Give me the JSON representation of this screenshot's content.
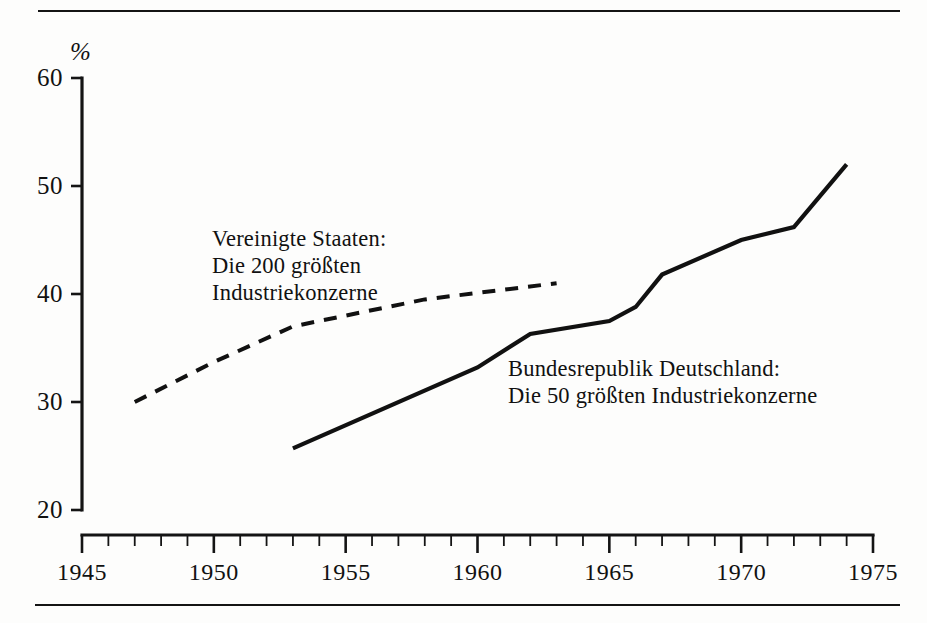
{
  "chart_data": {
    "type": "line",
    "title": "",
    "subtitle": "",
    "xlabel": "",
    "ylabel": "%",
    "unit_symbol": "%",
    "xlim": [
      1945,
      1975
    ],
    "ylim": [
      20,
      60
    ],
    "grid": false,
    "legend_position": "inline-annotations",
    "x_ticks_major": [
      1945,
      1950,
      1955,
      1960,
      1965,
      1970,
      1975
    ],
    "x_tick_labels": [
      "1945",
      "1950",
      "1955",
      "1960",
      "1965",
      "1970",
      "1975"
    ],
    "x_ticks_minor_step": 1,
    "y_ticks": [
      20,
      30,
      40,
      50,
      60
    ],
    "y_tick_labels": [
      "20",
      "30",
      "40",
      "50",
      "60"
    ],
    "series": [
      {
        "name": "Vereinigte Staaten: Die 200 größten Industriekonzerne",
        "style": "dashed",
        "annotation_lines": [
          "Vereinigte Staaten:",
          "Die 200 größten",
          "Industriekonzerne"
        ],
        "x": [
          1947,
          1950,
          1953,
          1958,
          1963
        ],
        "values": [
          30.0,
          33.7,
          37.0,
          39.5,
          41.0
        ]
      },
      {
        "name": "Bundesrepublik Deutschland: Die 50 größten Industriekonzerne",
        "style": "solid",
        "annotation_lines": [
          "Bundesrepublik Deutschland:",
          "Die 50 größten Industriekonzerne"
        ],
        "x": [
          1953,
          1960,
          1962,
          1965,
          1966,
          1967,
          1970,
          1972,
          1974
        ],
        "values": [
          25.7,
          33.2,
          36.3,
          37.5,
          38.8,
          41.8,
          45.0,
          46.2,
          52.0
        ]
      }
    ]
  },
  "colors": {
    "ink": "#111111",
    "background": "#ffffff",
    "rule": "#141414"
  },
  "annotations": {
    "us_line_1": "Vereinigte Staaten:",
    "us_line_2": "Die 200 größten",
    "us_line_3": "Industriekonzerne",
    "frg_line_1": "Bundesrepublik Deutschland:",
    "frg_line_2": "Die 50 größten Industriekonzerne"
  }
}
